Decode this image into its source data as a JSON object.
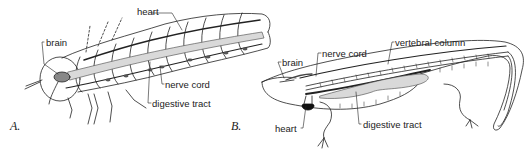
{
  "figure": {
    "panels": [
      {
        "id": "A",
        "letter": "A.",
        "subject": "insect-larva",
        "labels": {
          "heart": "heart",
          "brain": "brain",
          "nerve_cord": "nerve cord",
          "digestive_tract": "digestive tract"
        }
      },
      {
        "id": "B",
        "letter": "B.",
        "subject": "salamander",
        "labels": {
          "brain": "brain",
          "nerve_cord": "nerve cord",
          "vertebral_column": "vertebral column",
          "heart": "heart",
          "digestive_tract": "digestive tract"
        }
      }
    ],
    "colors": {
      "ink": "#222222",
      "fill_gray": "#d9d9d9",
      "background": "#ffffff"
    }
  }
}
